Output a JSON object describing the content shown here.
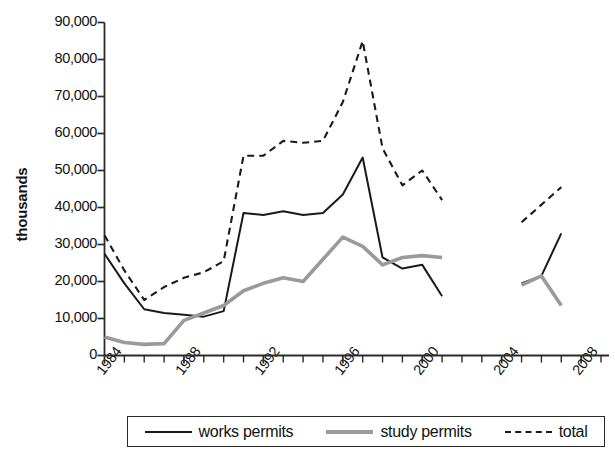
{
  "chart_data": {
    "type": "line",
    "title": "",
    "xlabel": "",
    "ylabel": "thousands",
    "ylim": [
      0,
      90000
    ],
    "xlim": [
      1984,
      2009
    ],
    "grid": false,
    "legend_position": "bottom",
    "y_ticks": [
      "0",
      "10,000",
      "20,000",
      "30,000",
      "40,000",
      "50,000",
      "60,000",
      "70,000",
      "80,000",
      "90,000"
    ],
    "y_tick_values": [
      0,
      10000,
      20000,
      30000,
      40000,
      50000,
      60000,
      70000,
      80000,
      90000
    ],
    "x_ticks": [
      "1984",
      "1988",
      "1992",
      "1996",
      "2000",
      "2004",
      "2008"
    ],
    "x_tick_values": [
      1984,
      1988,
      1992,
      1996,
      2000,
      2004,
      2008
    ],
    "x_minor_tick_values": [
      1984,
      1985,
      1986,
      1987,
      1988,
      1989,
      1990,
      1991,
      1992,
      1993,
      1994,
      1995,
      1996,
      1997,
      1998,
      1999,
      2000,
      2001,
      2002,
      2003,
      2004,
      2005,
      2006,
      2007,
      2008,
      2009
    ],
    "series": [
      {
        "name": "works permits",
        "style": "solid",
        "color": "#1a1a1a",
        "x": [
          1984,
          1985,
          1986,
          1987,
          1988,
          1989,
          1990,
          1991,
          1992,
          1993,
          1994,
          1995,
          1996,
          1997,
          1998,
          1999,
          2000,
          2001
        ],
        "values": [
          27500,
          19500,
          12500,
          11500,
          11000,
          10500,
          12000,
          38500,
          38000,
          39000,
          38000,
          38500,
          43500,
          53500,
          26500,
          23500,
          24500,
          16000
        ]
      },
      {
        "name": "works permits",
        "style": "solid",
        "color": "#1a1a1a",
        "segment": "late",
        "x": [
          2005,
          2006,
          2007
        ],
        "values": [
          19500,
          21500,
          33000
        ]
      },
      {
        "name": "study permits",
        "style": "solid",
        "color": "#9a9a9a",
        "x": [
          1984,
          1985,
          1986,
          1987,
          1988,
          1989,
          1990,
          1991,
          1992,
          1993,
          1994,
          1995,
          1996,
          1997,
          1998,
          1999,
          2000,
          2001
        ],
        "values": [
          5000,
          3500,
          3000,
          3200,
          9500,
          11500,
          13500,
          17500,
          19500,
          21000,
          20000,
          26000,
          32000,
          29500,
          24500,
          26500,
          27000,
          26500
        ]
      },
      {
        "name": "study permits",
        "style": "solid",
        "color": "#9a9a9a",
        "segment": "late",
        "x": [
          2005,
          2006,
          2007
        ],
        "values": [
          19000,
          21500,
          13500
        ]
      },
      {
        "name": "total",
        "style": "dashed",
        "color": "#1a1a1a",
        "x": [
          1984,
          1985,
          1986,
          1987,
          1988,
          1989,
          1990,
          1991,
          1992,
          1993,
          1994,
          1995,
          1996,
          1997,
          1998,
          1999,
          2000,
          2001
        ],
        "values": [
          32500,
          23000,
          15000,
          18500,
          21000,
          22500,
          25500,
          54000,
          54000,
          58000,
          57500,
          58000,
          68500,
          85000,
          56000,
          46000,
          50000,
          42000
        ]
      },
      {
        "name": "total",
        "style": "dashed",
        "color": "#1a1a1a",
        "segment": "late",
        "x": [
          2005,
          2007
        ],
        "values": [
          36000,
          45500
        ]
      }
    ]
  },
  "axes": {
    "y_title": "thousands"
  },
  "legend": {
    "items": [
      {
        "label": "works permits",
        "style": "solid-black"
      },
      {
        "label": "study permits",
        "style": "solid-gray"
      },
      {
        "label": "total",
        "style": "dashed"
      }
    ]
  }
}
